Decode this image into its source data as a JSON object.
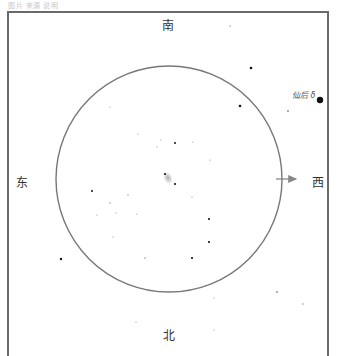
{
  "caption": "图片 来源 说明",
  "directions": {
    "south": "南",
    "north": "北",
    "east": "东",
    "west": "西"
  },
  "named_star": {
    "label": "仙后 δ",
    "x": 320,
    "y": 100,
    "r": 3.2
  },
  "field": {
    "cx": 169,
    "cy": 179,
    "r": 113,
    "stroke": "#777777"
  },
  "arrow": {
    "x1": 276,
    "y1": 179,
    "x2": 296,
    "y2": 179,
    "color": "#888888"
  },
  "galaxy": {
    "cx": 168,
    "cy": 178,
    "rx": 5,
    "ry": 7
  },
  "stars": [
    {
      "x": 230,
      "y": 26,
      "r": 0.7
    },
    {
      "x": 251,
      "y": 68,
      "r": 1.3
    },
    {
      "x": 240,
      "y": 106,
      "r": 1.3
    },
    {
      "x": 288,
      "y": 111,
      "r": 0.9
    },
    {
      "x": 320,
      "y": 100,
      "r": 3.2
    },
    {
      "x": 110,
      "y": 107,
      "r": 0.6
    },
    {
      "x": 138,
      "y": 134,
      "r": 0.6
    },
    {
      "x": 161,
      "y": 140,
      "r": 0.6
    },
    {
      "x": 175,
      "y": 143,
      "r": 1.0
    },
    {
      "x": 193,
      "y": 142,
      "r": 0.6
    },
    {
      "x": 210,
      "y": 160,
      "r": 0.6
    },
    {
      "x": 192,
      "y": 197,
      "r": 0.6
    },
    {
      "x": 157,
      "y": 147,
      "r": 0.6
    },
    {
      "x": 165,
      "y": 174,
      "r": 1.1
    },
    {
      "x": 175,
      "y": 184,
      "r": 1.1
    },
    {
      "x": 92,
      "y": 191,
      "r": 1.0
    },
    {
      "x": 110,
      "y": 203,
      "r": 0.7
    },
    {
      "x": 97,
      "y": 215,
      "r": 0.6
    },
    {
      "x": 116,
      "y": 213,
      "r": 0.6
    },
    {
      "x": 128,
      "y": 195,
      "r": 0.7
    },
    {
      "x": 137,
      "y": 214,
      "r": 0.6
    },
    {
      "x": 113,
      "y": 237,
      "r": 0.6
    },
    {
      "x": 145,
      "y": 258,
      "r": 0.6
    },
    {
      "x": 209,
      "y": 219,
      "r": 1.1
    },
    {
      "x": 209,
      "y": 242,
      "r": 1.1
    },
    {
      "x": 192,
      "y": 258,
      "r": 1.1
    },
    {
      "x": 145,
      "y": 258,
      "r": 0.6
    },
    {
      "x": 61,
      "y": 259,
      "r": 1.2
    },
    {
      "x": 214,
      "y": 298,
      "r": 0.6
    },
    {
      "x": 136,
      "y": 322,
      "r": 0.6
    },
    {
      "x": 214,
      "y": 330,
      "r": 0.6
    },
    {
      "x": 277,
      "y": 292,
      "r": 0.9
    },
    {
      "x": 303,
      "y": 304,
      "r": 0.7
    }
  ]
}
